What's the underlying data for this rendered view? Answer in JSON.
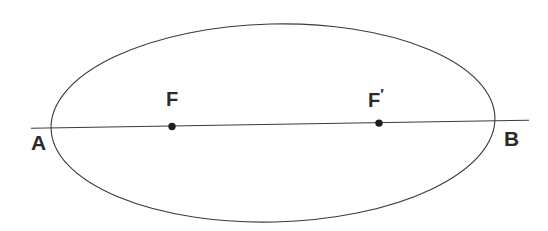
{
  "figure": {
    "background_color": "#ffffff",
    "stroke_color": "#3a3a3a",
    "label_color": "#2b2b2b",
    "width": 548,
    "height": 231
  },
  "labels": {
    "vertex_left": "A",
    "vertex_right": "B",
    "focus_left": "F",
    "focus_right": "F",
    "focus_right_prime": "′"
  },
  "geometry": {
    "ellipse": {
      "center_x": 273,
      "center_y": 123,
      "semi_major_axis": 222,
      "semi_minor_axis": 99,
      "rotation_degrees": -1.4,
      "stroke_width": 1.1
    },
    "axis_line": {
      "x1": 31,
      "y1": 128,
      "x2": 529,
      "y2": 120,
      "stroke_width": 1.1
    },
    "focus_left_point": {
      "x": 172,
      "y": 127,
      "radius": 3.6
    },
    "focus_right_point": {
      "x": 379,
      "y": 123,
      "radius": 3.6
    },
    "vertex_left_point": {
      "x": 52,
      "y": 126
    },
    "vertex_right_point": {
      "x": 495,
      "y": 121
    }
  }
}
